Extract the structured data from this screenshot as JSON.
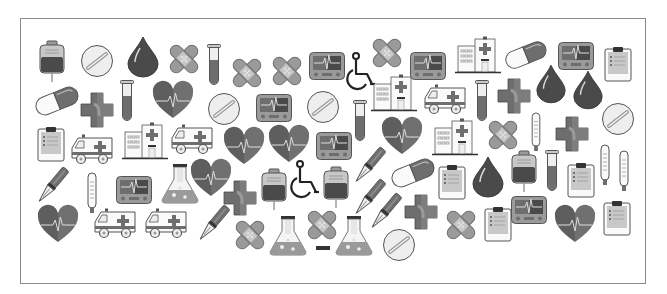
{
  "canvas": {
    "width": 667,
    "height": 294,
    "background": "#ffffff"
  },
  "frame": {
    "left": 20,
    "top": 18,
    "right": 646,
    "bottom": 284,
    "border_color": "#8a8a8a"
  },
  "palette": {
    "dark": "#4a4a4a",
    "mid": "#6e6e6e",
    "light": "#9a9a9a",
    "pale": "#c8c8c8",
    "paper": "#eeeeee",
    "outline": "#555555"
  },
  "icons": [
    {
      "type": "iv-bag",
      "x": 38,
      "y": 40,
      "w": 28,
      "h": 42
    },
    {
      "type": "pill-tablet",
      "x": 80,
      "y": 44,
      "w": 34,
      "h": 34
    },
    {
      "type": "blood-drop",
      "x": 126,
      "y": 36,
      "w": 34,
      "h": 42
    },
    {
      "type": "bandage",
      "x": 167,
      "y": 42,
      "w": 34,
      "h": 34
    },
    {
      "type": "test-tube",
      "x": 207,
      "y": 44,
      "w": 14,
      "h": 42
    },
    {
      "type": "bandage",
      "x": 230,
      "y": 56,
      "w": 34,
      "h": 34
    },
    {
      "type": "bandage",
      "x": 270,
      "y": 54,
      "w": 34,
      "h": 34
    },
    {
      "type": "ecg-monitor",
      "x": 309,
      "y": 52,
      "w": 36,
      "h": 28
    },
    {
      "type": "wheelchair",
      "x": 348,
      "y": 52,
      "w": 28,
      "h": 40
    },
    {
      "type": "bandage",
      "x": 370,
      "y": 36,
      "w": 34,
      "h": 34
    },
    {
      "type": "hospital",
      "x": 371,
      "y": 74,
      "w": 46,
      "h": 38
    },
    {
      "type": "ecg-monitor",
      "x": 410,
      "y": 52,
      "w": 36,
      "h": 28
    },
    {
      "type": "hospital",
      "x": 455,
      "y": 36,
      "w": 46,
      "h": 38
    },
    {
      "type": "capsule",
      "x": 504,
      "y": 40,
      "w": 44,
      "h": 30
    },
    {
      "type": "ecg-monitor",
      "x": 558,
      "y": 42,
      "w": 36,
      "h": 28
    },
    {
      "type": "clipboard",
      "x": 604,
      "y": 46,
      "w": 28,
      "h": 36
    },
    {
      "type": "capsule",
      "x": 34,
      "y": 86,
      "w": 46,
      "h": 30
    },
    {
      "type": "cross",
      "x": 80,
      "y": 92,
      "w": 34,
      "h": 36
    },
    {
      "type": "test-tube",
      "x": 120,
      "y": 80,
      "w": 14,
      "h": 42
    },
    {
      "type": "heart-ecg",
      "x": 152,
      "y": 82,
      "w": 42,
      "h": 38
    },
    {
      "type": "pill-tablet",
      "x": 207,
      "y": 92,
      "w": 34,
      "h": 34
    },
    {
      "type": "ecg-monitor",
      "x": 256,
      "y": 94,
      "w": 36,
      "h": 28
    },
    {
      "type": "pill-tablet",
      "x": 306,
      "y": 90,
      "w": 34,
      "h": 34
    },
    {
      "type": "test-tube",
      "x": 353,
      "y": 100,
      "w": 14,
      "h": 42
    },
    {
      "type": "ambulance",
      "x": 423,
      "y": 84,
      "w": 44,
      "h": 32
    },
    {
      "type": "test-tube",
      "x": 475,
      "y": 80,
      "w": 14,
      "h": 42
    },
    {
      "type": "cross",
      "x": 497,
      "y": 78,
      "w": 34,
      "h": 36
    },
    {
      "type": "blood-drop",
      "x": 535,
      "y": 64,
      "w": 32,
      "h": 40
    },
    {
      "type": "blood-drop",
      "x": 572,
      "y": 70,
      "w": 32,
      "h": 40
    },
    {
      "type": "pill-tablet",
      "x": 601,
      "y": 102,
      "w": 34,
      "h": 34
    },
    {
      "type": "clipboard",
      "x": 37,
      "y": 126,
      "w": 28,
      "h": 36
    },
    {
      "type": "ambulance",
      "x": 70,
      "y": 134,
      "w": 44,
      "h": 32
    },
    {
      "type": "hospital",
      "x": 122,
      "y": 122,
      "w": 46,
      "h": 38
    },
    {
      "type": "ambulance",
      "x": 170,
      "y": 124,
      "w": 44,
      "h": 32
    },
    {
      "type": "heart-ecg",
      "x": 223,
      "y": 128,
      "w": 42,
      "h": 38
    },
    {
      "type": "heart-ecg",
      "x": 268,
      "y": 126,
      "w": 42,
      "h": 38
    },
    {
      "type": "ecg-monitor",
      "x": 316,
      "y": 132,
      "w": 36,
      "h": 28
    },
    {
      "type": "heart-ecg",
      "x": 381,
      "y": 118,
      "w": 42,
      "h": 38
    },
    {
      "type": "hospital",
      "x": 432,
      "y": 118,
      "w": 46,
      "h": 38
    },
    {
      "type": "bandage",
      "x": 486,
      "y": 118,
      "w": 34,
      "h": 34
    },
    {
      "type": "thermometer",
      "x": 530,
      "y": 112,
      "w": 12,
      "h": 40
    },
    {
      "type": "cross",
      "x": 555,
      "y": 116,
      "w": 34,
      "h": 36
    },
    {
      "type": "scalpel",
      "x": 33,
      "y": 166,
      "w": 38,
      "h": 40
    },
    {
      "type": "thermometer",
      "x": 86,
      "y": 172,
      "w": 12,
      "h": 42
    },
    {
      "type": "ecg-monitor",
      "x": 116,
      "y": 176,
      "w": 36,
      "h": 28
    },
    {
      "type": "flask",
      "x": 160,
      "y": 164,
      "w": 40,
      "h": 40
    },
    {
      "type": "heart-ecg",
      "x": 190,
      "y": 160,
      "w": 42,
      "h": 38
    },
    {
      "type": "cross",
      "x": 223,
      "y": 180,
      "w": 34,
      "h": 36
    },
    {
      "type": "iv-bag",
      "x": 260,
      "y": 168,
      "w": 28,
      "h": 42
    },
    {
      "type": "wheelchair",
      "x": 292,
      "y": 160,
      "w": 28,
      "h": 40
    },
    {
      "type": "iv-bag",
      "x": 322,
      "y": 166,
      "w": 28,
      "h": 42
    },
    {
      "type": "scalpel",
      "x": 350,
      "y": 146,
      "w": 38,
      "h": 40
    },
    {
      "type": "capsule",
      "x": 390,
      "y": 158,
      "w": 46,
      "h": 30
    },
    {
      "type": "clipboard",
      "x": 438,
      "y": 164,
      "w": 28,
      "h": 36
    },
    {
      "type": "blood-drop",
      "x": 471,
      "y": 156,
      "w": 34,
      "h": 42
    },
    {
      "type": "iv-bag",
      "x": 510,
      "y": 150,
      "w": 28,
      "h": 42
    },
    {
      "type": "test-tube",
      "x": 545,
      "y": 150,
      "w": 14,
      "h": 42
    },
    {
      "type": "clipboard",
      "x": 567,
      "y": 162,
      "w": 28,
      "h": 36
    },
    {
      "type": "thermometer",
      "x": 599,
      "y": 144,
      "w": 12,
      "h": 42
    },
    {
      "type": "thermometer",
      "x": 618,
      "y": 150,
      "w": 12,
      "h": 42
    },
    {
      "type": "heart-ecg",
      "x": 37,
      "y": 206,
      "w": 42,
      "h": 38
    },
    {
      "type": "ambulance",
      "x": 93,
      "y": 208,
      "w": 44,
      "h": 32
    },
    {
      "type": "ambulance",
      "x": 144,
      "y": 208,
      "w": 44,
      "h": 32
    },
    {
      "type": "scalpel",
      "x": 194,
      "y": 204,
      "w": 38,
      "h": 40
    },
    {
      "type": "scalpel",
      "x": 350,
      "y": 178,
      "w": 38,
      "h": 40
    },
    {
      "type": "scalpel",
      "x": 366,
      "y": 192,
      "w": 38,
      "h": 40
    },
    {
      "type": "cross",
      "x": 404,
      "y": 194,
      "w": 34,
      "h": 36
    },
    {
      "type": "bandage",
      "x": 233,
      "y": 218,
      "w": 34,
      "h": 34
    },
    {
      "type": "flask",
      "x": 268,
      "y": 216,
      "w": 40,
      "h": 40
    },
    {
      "type": "bandage",
      "x": 305,
      "y": 208,
      "w": 34,
      "h": 34
    },
    {
      "type": "minus-bar",
      "x": 316,
      "y": 246,
      "w": 14,
      "h": 4
    },
    {
      "type": "flask",
      "x": 334,
      "y": 216,
      "w": 40,
      "h": 40
    },
    {
      "type": "pill-tablet",
      "x": 382,
      "y": 228,
      "w": 34,
      "h": 34
    },
    {
      "type": "bandage",
      "x": 444,
      "y": 208,
      "w": 34,
      "h": 34
    },
    {
      "type": "clipboard",
      "x": 484,
      "y": 206,
      "w": 28,
      "h": 36
    },
    {
      "type": "ecg-monitor",
      "x": 511,
      "y": 196,
      "w": 36,
      "h": 28
    },
    {
      "type": "heart-ecg",
      "x": 554,
      "y": 206,
      "w": 42,
      "h": 38
    },
    {
      "type": "clipboard",
      "x": 603,
      "y": 200,
      "w": 28,
      "h": 36
    }
  ]
}
